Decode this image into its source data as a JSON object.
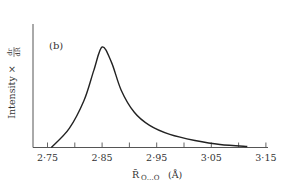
{
  "chart_data": {
    "type": "line",
    "panel_label": "(b)",
    "title": "",
    "xlabel": "R̄O…O(Å)",
    "xlabel_parts": {
      "symbol": "R̄",
      "subscript": "O…O",
      "unit": "(Å)"
    },
    "ylabel": "Intensity × dr/dR̄",
    "ylabel_parts": {
      "text": "Intensity ×",
      "frac_num": "dr",
      "frac_den": "dR̄"
    },
    "xlim": [
      2.75,
      3.15
    ],
    "ylim": [
      0,
      105
    ],
    "x_tick_values": [
      2.75,
      2.8,
      2.85,
      2.9,
      2.95,
      3.0,
      3.05,
      3.1,
      3.15
    ],
    "x_tick_labels": [
      "2·75",
      "",
      "2·85",
      "",
      "2·95",
      "",
      "3·05",
      "",
      "3·15"
    ],
    "y_ticks": [],
    "grid": false,
    "legend": null,
    "series": [
      {
        "name": "Intensity × dr/dR",
        "x": [
          2.757,
          2.79,
          2.817,
          2.835,
          2.85,
          2.867,
          2.885,
          2.909,
          2.937,
          2.974,
          3.02,
          3.066,
          3.116
        ],
        "values": [
          0,
          19,
          47,
          77,
          100,
          85,
          57,
          35,
          22,
          13,
          7,
          3,
          1
        ]
      }
    ]
  }
}
